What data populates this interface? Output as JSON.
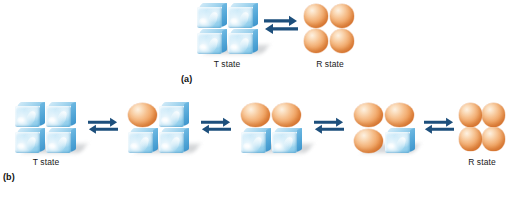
{
  "figure": {
    "background_color": "#ffffff",
    "subunit_colors": {
      "t_state_cube": "#a9d8f0",
      "r_state_sphere": "#f0a15f",
      "arrow": "#1d4f7c",
      "shadow": "#b9bcc0"
    }
  },
  "panel_a": {
    "label": "(a)",
    "left_label": "T state",
    "right_label": "R state",
    "left_assembly": {
      "name": "t-state-assembly",
      "subunits": [
        "cube",
        "cube",
        "cube",
        "cube"
      ],
      "count": 4
    },
    "right_assembly": {
      "name": "r-state-assembly",
      "subunits": [
        "sphere",
        "sphere",
        "sphere",
        "sphere"
      ],
      "count": 4
    },
    "arrow": {
      "name": "equilibrium-arrow",
      "type": "double-harpoon",
      "direction": "reversible"
    }
  },
  "panel_b": {
    "label": "(b)",
    "left_label": "T state",
    "right_label": "R state",
    "stages": [
      {
        "index": 1,
        "name": "stage-t-state",
        "label": "T state",
        "subunits": [
          "cube",
          "cube",
          "cube",
          "cube"
        ],
        "spheres": 0,
        "cubes": 4
      },
      {
        "index": 2,
        "name": "stage-one-sphere",
        "label": "",
        "subunits": [
          "sphere",
          "cube",
          "cube",
          "cube"
        ],
        "spheres": 1,
        "cubes": 3
      },
      {
        "index": 3,
        "name": "stage-two-spheres",
        "label": "",
        "subunits": [
          "sphere",
          "sphere",
          "cube",
          "cube"
        ],
        "spheres": 2,
        "cubes": 2
      },
      {
        "index": 4,
        "name": "stage-three-spheres",
        "label": "",
        "subunits": [
          "sphere",
          "sphere",
          "sphere",
          "cube"
        ],
        "spheres": 3,
        "cubes": 1
      },
      {
        "index": 5,
        "name": "stage-r-state",
        "label": "R state",
        "subunits": [
          "sphere",
          "sphere",
          "sphere",
          "sphere"
        ],
        "spheres": 4,
        "cubes": 0
      }
    ],
    "arrows": [
      {
        "index": 1,
        "name": "equilibrium-arrow",
        "type": "double-harpoon"
      },
      {
        "index": 2,
        "name": "equilibrium-arrow",
        "type": "double-harpoon"
      },
      {
        "index": 3,
        "name": "equilibrium-arrow",
        "type": "double-harpoon"
      },
      {
        "index": 4,
        "name": "equilibrium-arrow",
        "type": "double-harpoon"
      }
    ]
  }
}
